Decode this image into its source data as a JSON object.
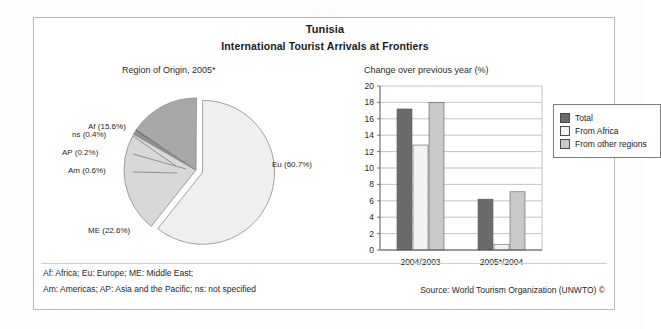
{
  "header": {
    "country": "Tunisia",
    "subtitle": "International Tourist Arrivals at Frontiers"
  },
  "pie_caption": "Region of Origin, 2005*",
  "bar_caption": "Change over previous year (%)",
  "footnotes": {
    "line1": "Af: Africa; Eu: Europe; ME: Middle East;",
    "line2": "Am: Americas; AP: Asia and the Pacific; ns: not specified"
  },
  "source": "Source: World Tourism Organization (UNWTO) ©",
  "colors": {
    "total": "#6b6b6b",
    "from_africa": "#f2f2f2",
    "from_other": "#c9c9c9",
    "pie_eu": "#efefef",
    "pie_af": "#a8a8a8",
    "pie_me": "#d8d8d8",
    "axis": "#555555",
    "grid": "#9a9a9a",
    "frame": "#b9b9b9"
  },
  "chart_data": [
    {
      "type": "pie",
      "title": "Region of Origin, 2005*",
      "legend": "labels-on-slices",
      "exploded_slice": "Eu",
      "labels": [
        "Eu",
        "ME",
        "Af",
        "Am",
        "AP",
        "ns"
      ],
      "values": [
        60.7,
        22.6,
        15.6,
        0.6,
        0.2,
        0.4
      ],
      "slice_labels": [
        "Eu (60.7%)",
        "ME (22.6%)",
        "Af (15.6%)",
        "Am (0.6%)",
        "AP (0.2%)",
        "ns (0.4%)"
      ],
      "unit": "%"
    },
    {
      "type": "bar",
      "title": "Change over previous year (%)",
      "categories": [
        "2004/2003",
        "2005*/2004"
      ],
      "series": [
        {
          "name": "Total",
          "values": [
            17.2,
            6.2
          ]
        },
        {
          "name": "From Africa",
          "values": [
            12.8,
            0.7
          ]
        },
        {
          "name": "From other regions",
          "values": [
            18.0,
            7.1
          ]
        }
      ],
      "xlabel": "",
      "ylabel": "",
      "ylim": [
        0,
        20
      ],
      "yticks": [
        0,
        2,
        4,
        6,
        8,
        10,
        12,
        14,
        16,
        18,
        20
      ],
      "ytick_labels": [
        "0",
        "2",
        "4",
        "6",
        "8",
        "10",
        "12",
        "14",
        "16",
        "18",
        "20"
      ],
      "grid": true,
      "legend_position": "right"
    }
  ]
}
